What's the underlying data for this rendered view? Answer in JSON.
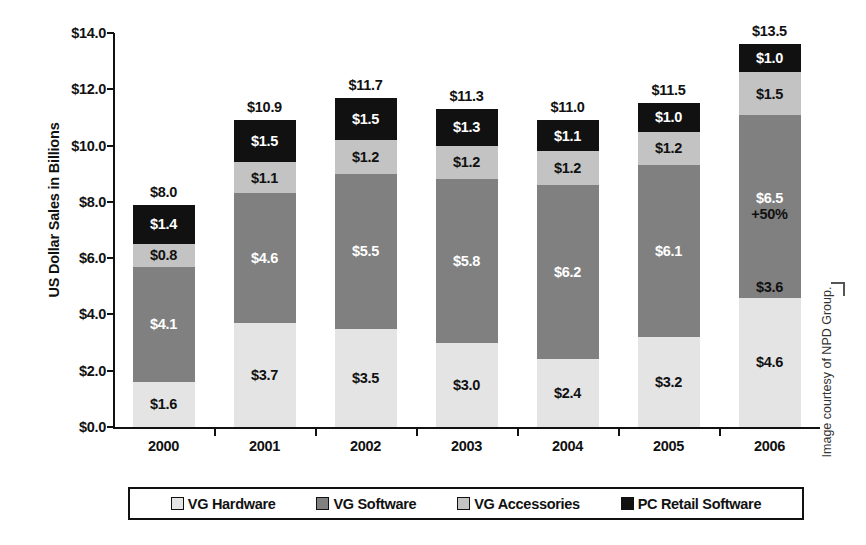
{
  "chart_data": {
    "type": "bar",
    "stacked": true,
    "title": "",
    "xlabel": "",
    "ylabel": "US Dollar Sales in Billions",
    "ylim": [
      0,
      14
    ],
    "ytick_step": 2,
    "grid": false,
    "legend_position": "bottom",
    "categories": [
      "2000",
      "2001",
      "2002",
      "2003",
      "2004",
      "2005",
      "2006"
    ],
    "series": [
      {
        "name": "VG Hardware",
        "color": "#e4e4e4",
        "values": [
          1.6,
          3.7,
          3.5,
          3.0,
          2.4,
          3.2,
          4.6
        ]
      },
      {
        "name": "VG Software",
        "color": "#808080",
        "values": [
          4.1,
          4.6,
          5.5,
          5.8,
          6.2,
          6.1,
          6.5
        ]
      },
      {
        "name": "VG Accessories",
        "color": "#c3c3c3",
        "values": [
          0.8,
          1.1,
          1.2,
          1.2,
          1.2,
          1.2,
          1.5
        ]
      },
      {
        "name": "PC Retail Software",
        "color": "#111111",
        "values": [
          1.4,
          1.5,
          1.5,
          1.3,
          1.1,
          1.0,
          1.0
        ]
      }
    ],
    "totals": [
      8.0,
      10.9,
      11.7,
      11.3,
      11.0,
      11.5,
      13.5
    ],
    "total_labels": [
      "$8.0",
      "$10.9",
      "$11.7",
      "$11.3",
      "$11.0",
      "$11.5",
      "$13.5"
    ],
    "segment_labels": [
      [
        "$1.6",
        "$4.1",
        "$0.8",
        "$1.4"
      ],
      [
        "$3.7",
        "$4.6",
        "$1.1",
        "$1.5"
      ],
      [
        "$3.5",
        "$5.5",
        "$1.2",
        "$1.5"
      ],
      [
        "$3.0",
        "$5.8",
        "$1.2",
        "$1.3"
      ],
      [
        "$2.4",
        "$6.2",
        "$1.2",
        "$1.1"
      ],
      [
        "$3.2",
        "$6.1",
        "$1.2",
        "$1.0"
      ],
      [
        "$4.6",
        "$6.5",
        "$1.5",
        "$1.0"
      ]
    ],
    "ytick_labels": [
      "$0.0",
      "$2.0",
      "$4.0",
      "$6.0",
      "$8.0",
      "$10.0",
      "$12.0",
      "$14.0"
    ],
    "ytick_values": [
      0,
      2,
      4,
      6,
      8,
      10,
      12,
      14
    ],
    "annotations": [
      {
        "category": "2006",
        "series": "VG Software",
        "text": "+50%"
      },
      {
        "category": "2006",
        "series": "VG Software",
        "text": "$3.6",
        "position": "bottom"
      }
    ]
  },
  "legend": {
    "items": [
      {
        "label": "VG Hardware",
        "swatch_class": "sw-hardware"
      },
      {
        "label": "VG Software",
        "swatch_class": "sw-software"
      },
      {
        "label": "VG Accessories",
        "swatch_class": "sw-accessories"
      },
      {
        "label": "PC Retail Software",
        "swatch_class": "sw-pcretail"
      }
    ]
  },
  "credit": {
    "text": "Image courtesy of NPD Group."
  }
}
